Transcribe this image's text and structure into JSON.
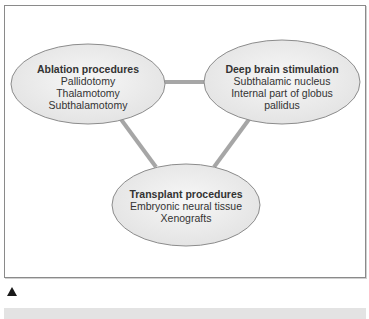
{
  "diagram": {
    "type": "triangle-relationship",
    "colors": {
      "node_fill": "#ececec",
      "node_stroke": "#8c8c8c",
      "connector": "#a6a6a6",
      "frame_border": "#8a8a8a",
      "caption_bar": "#e3e3e3"
    },
    "nodes": [
      {
        "id": "ablation",
        "title": "Ablation procedures",
        "items": [
          "Pallidotomy",
          "Thalamotomy",
          "Subthalamotomy"
        ]
      },
      {
        "id": "dbs",
        "title": "Deep brain stimulation",
        "items": [
          "Subthalamic nucleus",
          "Internal part of globus",
          "pallidus"
        ]
      },
      {
        "id": "transplant",
        "title": "Transplant procedures",
        "items": [
          "Embryonic neural tissue",
          "Xenografts"
        ]
      }
    ],
    "edges": [
      {
        "from": "ablation",
        "to": "dbs"
      },
      {
        "from": "ablation",
        "to": "transplant"
      },
      {
        "from": "dbs",
        "to": "transplant"
      }
    ]
  },
  "marker": {
    "icon": "triangle-up-icon"
  },
  "caption": {
    "text": ""
  }
}
